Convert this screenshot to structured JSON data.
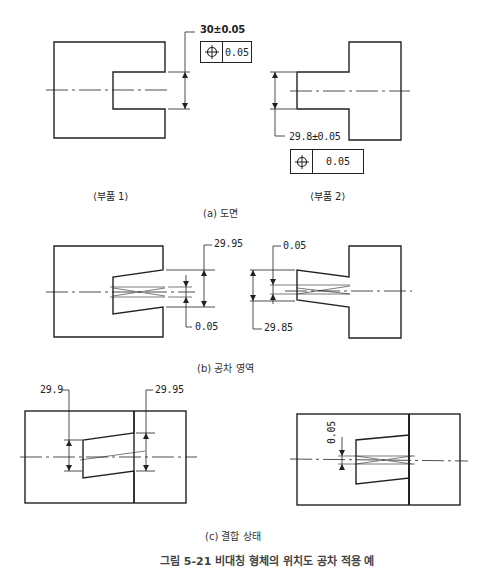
{
  "section_a": {
    "caption": "(a) 도면",
    "part1": {
      "label": "⟨부품 1⟩",
      "dimension": "30±0.05",
      "frame": {
        "symbol": "position-icon",
        "tolerance": "0.05"
      }
    },
    "part2": {
      "label": "⟨부품 2⟩",
      "dimension": "29.8±0.05",
      "frame": {
        "symbol": "position-icon",
        "tolerance": "0.05"
      }
    }
  },
  "section_b": {
    "caption": "(b) 공차 영역",
    "part1": {
      "outer_dim": "29.95",
      "zone_dim": "0.05"
    },
    "part2": {
      "zone_dim": "0.05",
      "outer_dim": "29.85"
    }
  },
  "section_c": {
    "caption": "(c) 결합 상태",
    "left": {
      "dim_left": "29.9",
      "dim_right": "29.95"
    },
    "right": {
      "zone_dim": "0.05"
    }
  },
  "figure_caption": "그림 5-21  비대칭 형체의 위치도 공차 적용 예",
  "colors": {
    "line": "#222222",
    "background": "#ffffff"
  }
}
